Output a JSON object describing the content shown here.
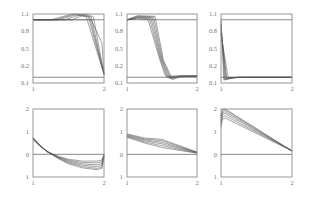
{
  "chart_data": [
    {
      "type": "line",
      "panel": "top-left",
      "row": 0,
      "col": 0,
      "title": "",
      "xlabel": "",
      "ylabel": "",
      "xlim": [
        1,
        2
      ],
      "ylim": [
        -0.1,
        1.1
      ],
      "xticks": [
        "1",
        "2"
      ],
      "yticks": [
        {
          "v": 1.1,
          "label": "1.1"
        },
        {
          "v": 0.8,
          "label": "0.8"
        },
        {
          "v": 0.5,
          "label": "0.5"
        },
        {
          "v": 0.2,
          "label": "0.2"
        },
        {
          "v": -0.1,
          "label": "0.1"
        }
      ],
      "reference_lines": [
        0,
        1
      ],
      "grid": false,
      "series": [
        {
          "name": "s1",
          "x": [
            1,
            1.5,
            1.82,
            1.97,
            2
          ],
          "y": [
            1,
            1,
            1.0,
            0.6,
            0.05
          ]
        },
        {
          "name": "s2",
          "x": [
            1,
            1.55,
            1.75,
            1.85,
            2
          ],
          "y": [
            1,
            1,
            1.1,
            1.05,
            0.05
          ]
        },
        {
          "name": "s3",
          "x": [
            1,
            1.45,
            1.7,
            1.82,
            2
          ],
          "y": [
            1,
            1,
            1.1,
            1.05,
            0.05
          ]
        },
        {
          "name": "s4",
          "x": [
            1,
            1.35,
            1.65,
            1.8,
            2
          ],
          "y": [
            1,
            1,
            1.1,
            1.05,
            0.05
          ]
        },
        {
          "name": "s5",
          "x": [
            1,
            1.3,
            1.6,
            1.78,
            2
          ],
          "y": [
            1,
            1,
            1.1,
            1.05,
            0.05
          ]
        },
        {
          "name": "s6",
          "x": [
            1,
            1.25,
            1.55,
            1.75,
            2
          ],
          "y": [
            1,
            1,
            1.1,
            1.05,
            0.05
          ]
        }
      ]
    },
    {
      "type": "line",
      "panel": "top-middle",
      "row": 0,
      "col": 1,
      "title": "",
      "xlabel": "",
      "ylabel": "",
      "xlim": [
        1,
        2
      ],
      "ylim": [
        -0.1,
        1.1
      ],
      "xticks": [
        "1",
        "2"
      ],
      "yticks": [
        {
          "v": 1.1,
          "label": "1.1"
        },
        {
          "v": 0.8,
          "label": "0.8"
        },
        {
          "v": 0.5,
          "label": "0.5"
        },
        {
          "v": 0.2,
          "label": "0.2"
        },
        {
          "v": -0.1,
          "label": "0.1"
        }
      ],
      "reference_lines": [
        0,
        1
      ],
      "grid": false,
      "series": [
        {
          "name": "s1",
          "x": [
            1,
            1.15,
            1.3,
            1.47,
            1.55,
            1.7,
            2
          ],
          "y": [
            1,
            1.02,
            1.0,
            0.3,
            0.02,
            0.02,
            0.02
          ]
        },
        {
          "name": "s2",
          "x": [
            1,
            1.15,
            1.32,
            1.48,
            1.57,
            1.72,
            2
          ],
          "y": [
            1,
            1.03,
            1.02,
            0.3,
            0.0,
            0.02,
            0.02
          ]
        },
        {
          "name": "s3",
          "x": [
            1,
            1.15,
            1.34,
            1.49,
            1.59,
            1.74,
            2
          ],
          "y": [
            1,
            1.04,
            1.03,
            0.3,
            -0.01,
            0.02,
            0.02
          ]
        },
        {
          "name": "s4",
          "x": [
            1,
            1.15,
            1.36,
            1.5,
            1.61,
            1.76,
            2
          ],
          "y": [
            1,
            1.05,
            1.04,
            0.3,
            -0.02,
            0.02,
            0.02
          ]
        },
        {
          "name": "s5",
          "x": [
            1,
            1.15,
            1.38,
            1.51,
            1.63,
            1.78,
            2
          ],
          "y": [
            1,
            1.06,
            1.05,
            0.3,
            -0.03,
            0.02,
            0.02
          ]
        },
        {
          "name": "s6",
          "x": [
            1,
            1.15,
            1.4,
            1.52,
            1.65,
            1.8,
            2
          ],
          "y": [
            1,
            1.07,
            1.06,
            0.3,
            -0.04,
            0.02,
            0.02
          ]
        }
      ]
    },
    {
      "type": "line",
      "panel": "top-right",
      "row": 0,
      "col": 2,
      "title": "",
      "xlabel": "",
      "ylabel": "",
      "xlim": [
        1,
        2
      ],
      "ylim": [
        -0.1,
        1.1
      ],
      "xticks": [
        "1",
        "2"
      ],
      "yticks": [
        {
          "v": 1.1,
          "label": "1.1"
        },
        {
          "v": 0.8,
          "label": "0.8"
        },
        {
          "v": 0.5,
          "label": "0.5"
        },
        {
          "v": 0.2,
          "label": "0.2"
        },
        {
          "v": -0.1,
          "label": "0.1"
        }
      ],
      "reference_lines": [
        0,
        1
      ],
      "grid": false,
      "series": [
        {
          "name": "s1",
          "x": [
            1,
            1.04,
            1.2,
            2
          ],
          "y": [
            1.0,
            -0.05,
            0.0,
            0.0
          ]
        },
        {
          "name": "s2",
          "x": [
            1,
            1.05,
            1.22,
            2
          ],
          "y": [
            0.95,
            -0.04,
            0.0,
            0.0
          ]
        },
        {
          "name": "s3",
          "x": [
            1,
            1.06,
            1.25,
            2
          ],
          "y": [
            0.9,
            -0.03,
            0.0,
            0.0
          ]
        },
        {
          "name": "s4",
          "x": [
            1,
            1.07,
            1.28,
            2
          ],
          "y": [
            0.85,
            -0.02,
            0.0,
            0.0
          ]
        },
        {
          "name": "s5",
          "x": [
            1,
            1.08,
            1.3,
            2
          ],
          "y": [
            0.8,
            -0.01,
            0.0,
            0.0
          ]
        },
        {
          "name": "s6",
          "x": [
            1,
            1.1,
            1.32,
            2
          ],
          "y": [
            0.75,
            0.0,
            0.0,
            0.0
          ]
        }
      ]
    },
    {
      "type": "line",
      "panel": "bottom-left",
      "row": 1,
      "col": 0,
      "title": "",
      "xlabel": "",
      "ylabel": "",
      "xlim": [
        1,
        2
      ],
      "ylim": [
        -1,
        2
      ],
      "xticks": [
        "1",
        "2"
      ],
      "yticks": [
        {
          "v": 2,
          "label": "2"
        },
        {
          "v": 1,
          "label": "1"
        },
        {
          "v": 0,
          "label": "0"
        },
        {
          "v": -1,
          "label": "1"
        }
      ],
      "reference_lines": [
        0
      ],
      "grid": false,
      "series": [
        {
          "name": "s1",
          "x": [
            1,
            1.1,
            1.2,
            1.35,
            1.5,
            1.7,
            1.9,
            1.97,
            2
          ],
          "y": [
            0.65,
            0.35,
            0.12,
            -0.08,
            -0.22,
            -0.3,
            -0.3,
            -0.25,
            0.0
          ]
        },
        {
          "name": "s2",
          "x": [
            1,
            1.1,
            1.2,
            1.35,
            1.5,
            1.7,
            1.9,
            1.97,
            2
          ],
          "y": [
            0.67,
            0.36,
            0.12,
            -0.1,
            -0.26,
            -0.36,
            -0.38,
            -0.32,
            -0.02
          ]
        },
        {
          "name": "s3",
          "x": [
            1,
            1.1,
            1.2,
            1.35,
            1.5,
            1.7,
            1.9,
            1.97,
            2
          ],
          "y": [
            0.69,
            0.37,
            0.12,
            -0.12,
            -0.3,
            -0.42,
            -0.46,
            -0.4,
            -0.04
          ]
        },
        {
          "name": "s4",
          "x": [
            1,
            1.1,
            1.2,
            1.35,
            1.5,
            1.7,
            1.9,
            1.97,
            2
          ],
          "y": [
            0.71,
            0.38,
            0.12,
            -0.14,
            -0.34,
            -0.48,
            -0.54,
            -0.48,
            -0.06
          ]
        },
        {
          "name": "s5",
          "x": [
            1,
            1.1,
            1.2,
            1.35,
            1.5,
            1.7,
            1.9,
            1.97,
            2
          ],
          "y": [
            0.73,
            0.39,
            0.12,
            -0.16,
            -0.38,
            -0.54,
            -0.62,
            -0.56,
            -0.08
          ]
        },
        {
          "name": "s6",
          "x": [
            1,
            1.1,
            1.2,
            1.35,
            1.5,
            1.7,
            1.9,
            1.97,
            2
          ],
          "y": [
            0.75,
            0.4,
            0.12,
            -0.18,
            -0.42,
            -0.6,
            -0.68,
            -0.62,
            -0.1
          ]
        }
      ]
    },
    {
      "type": "line",
      "panel": "bottom-middle",
      "row": 1,
      "col": 1,
      "title": "",
      "xlabel": "",
      "ylabel": "",
      "xlim": [
        1,
        2
      ],
      "ylim": [
        -1,
        2
      ],
      "xticks": [
        "1",
        "2"
      ],
      "yticks": [
        {
          "v": 2,
          "label": "2"
        },
        {
          "v": 1,
          "label": "1"
        },
        {
          "v": 0,
          "label": "0"
        },
        {
          "v": -1,
          "label": "1"
        }
      ],
      "reference_lines": [
        0
      ],
      "grid": false,
      "series": [
        {
          "name": "s1",
          "x": [
            1,
            1.25,
            1.5,
            2
          ],
          "y": [
            0.75,
            0.5,
            0.3,
            0.05
          ]
        },
        {
          "name": "s2",
          "x": [
            1,
            1.25,
            1.5,
            2
          ],
          "y": [
            0.78,
            0.55,
            0.38,
            0.06
          ]
        },
        {
          "name": "s3",
          "x": [
            1,
            1.25,
            1.5,
            2
          ],
          "y": [
            0.81,
            0.6,
            0.46,
            0.07
          ]
        },
        {
          "name": "s4",
          "x": [
            1,
            1.25,
            1.5,
            2
          ],
          "y": [
            0.84,
            0.64,
            0.53,
            0.08
          ]
        },
        {
          "name": "s5",
          "x": [
            1,
            1.25,
            1.5,
            2
          ],
          "y": [
            0.87,
            0.68,
            0.6,
            0.09
          ]
        },
        {
          "name": "s6",
          "x": [
            1,
            1.25,
            1.5,
            2
          ],
          "y": [
            0.9,
            0.72,
            0.66,
            0.1
          ]
        }
      ]
    },
    {
      "type": "line",
      "panel": "bottom-right",
      "row": 1,
      "col": 2,
      "title": "",
      "xlabel": "",
      "ylabel": "",
      "xlim": [
        1,
        2
      ],
      "ylim": [
        -1,
        2
      ],
      "xticks": [
        "1",
        "2"
      ],
      "yticks": [
        {
          "v": 2,
          "label": "2"
        },
        {
          "v": 1,
          "label": "1"
        },
        {
          "v": 0,
          "label": "0"
        },
        {
          "v": -1,
          "label": "1"
        }
      ],
      "reference_lines": [
        0
      ],
      "grid": false,
      "series": [
        {
          "name": "s1",
          "x": [
            1,
            1.02,
            1.06,
            2
          ],
          "y": [
            1.2,
            1.55,
            1.6,
            0.15
          ]
        },
        {
          "name": "s2",
          "x": [
            1,
            1.02,
            1.06,
            2
          ],
          "y": [
            1.3,
            1.65,
            1.7,
            0.15
          ]
        },
        {
          "name": "s3",
          "x": [
            1,
            1.02,
            1.06,
            2
          ],
          "y": [
            1.4,
            1.75,
            1.8,
            0.15
          ]
        },
        {
          "name": "s4",
          "x": [
            1,
            1.02,
            1.06,
            2
          ],
          "y": [
            1.5,
            1.83,
            1.88,
            0.15
          ]
        },
        {
          "name": "s5",
          "x": [
            1,
            1.02,
            1.06,
            2
          ],
          "y": [
            1.6,
            1.9,
            1.95,
            0.15
          ]
        },
        {
          "name": "s6",
          "x": [
            1,
            1.02,
            1.06,
            2
          ],
          "y": [
            1.7,
            1.97,
            2.0,
            0.15
          ]
        }
      ]
    }
  ],
  "layout": {
    "columns": [
      [
        33,
        104
      ],
      [
        127,
        197
      ],
      [
        221,
        292
      ]
    ],
    "rows": [
      [
        14,
        83
      ],
      [
        109,
        177
      ]
    ]
  }
}
